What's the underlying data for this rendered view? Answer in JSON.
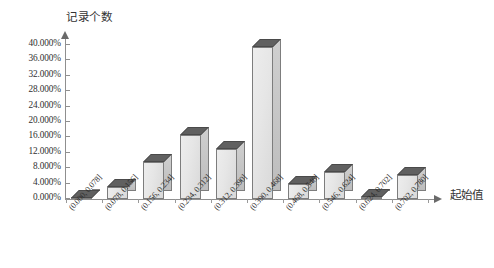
{
  "chart_data": {
    "type": "bar",
    "title": "",
    "subtitle": "",
    "ylabel": "记录个数",
    "xlabel": "起始值",
    "grid": false,
    "legend": false,
    "legend_position": "none",
    "style": "3d-column-histogram",
    "yaxis": {
      "min": 0,
      "max": 40,
      "step": 4,
      "unit": "%",
      "ticks": [
        "0.000%",
        "4.000%",
        "8.000%",
        "12.000%",
        "16.000%",
        "20.000%",
        "24.000%",
        "28.000%",
        "32.000%",
        "36.000%",
        "40.000%"
      ]
    },
    "categories": [
      "(0.000, 0.078]",
      "(0.078, 0.156]",
      "(0.156, 0.234]",
      "(0.234, 0.312]",
      "(0.312, 0.390]",
      "(0.390, 0.468]",
      "(0.468, 0.546]",
      "(0.546, 0.624]",
      "(0.624, 0.702]",
      "(0.702, 0.780]"
    ],
    "values": [
      0.2,
      3.0,
      9.6,
      16.5,
      13.0,
      39.6,
      3.8,
      7.0,
      0.5,
      6.2
    ],
    "colors": {
      "bar_front": "#e6e6e6",
      "bar_side": "#c6c6c6",
      "bar_top": "#5c5c5c",
      "bar_outline": "#7d7d7d",
      "axis": "#8f8f8f",
      "text": "#2f2f2f"
    }
  }
}
